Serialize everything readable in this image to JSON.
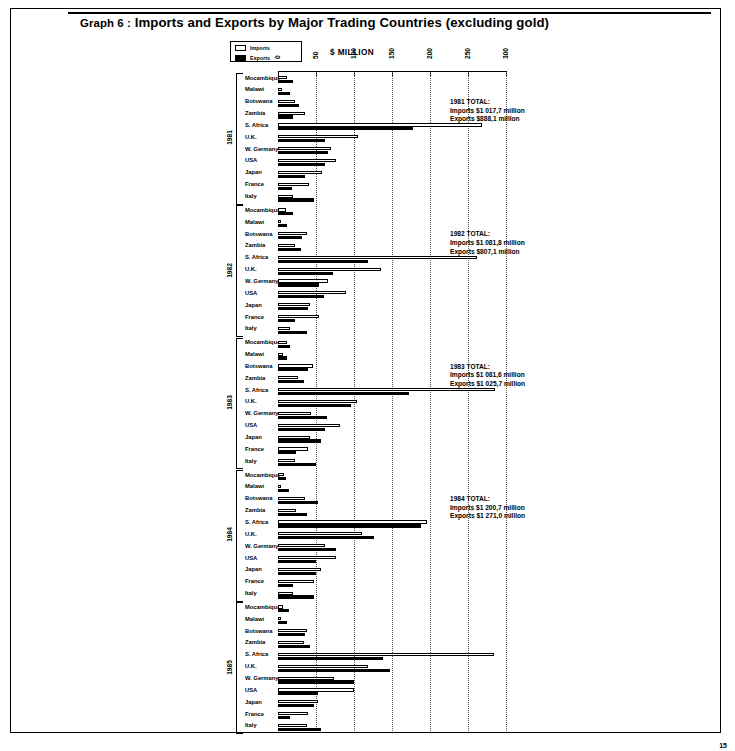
{
  "page": {
    "number": "15"
  },
  "header": {
    "graph_label": "Graph 6 :",
    "title": "Imports and Exports by Major Trading Countries (excluding gold)"
  },
  "legend": {
    "items": [
      {
        "key": "imports",
        "label": "Imports",
        "swatch": "open"
      },
      {
        "key": "exports",
        "label": "Exports",
        "swatch": "filled"
      }
    ]
  },
  "axis": {
    "title": "$ MILLION",
    "ticks": [
      "0",
      "50",
      "100",
      "150",
      "200",
      "250",
      "300"
    ],
    "min": 0,
    "max": 300
  },
  "countries": [
    "Mocambique",
    "Malawi",
    "Botswana",
    "Zambia",
    "S. Africa",
    "U.K.",
    "W. Germany",
    "USA",
    "Japan",
    "France",
    "Italy"
  ],
  "notes": [
    {
      "year": "1981",
      "line1": "1981 TOTAL:",
      "line2": "Imports $1 017,7 million",
      "line3": "Exports $888,1 million"
    },
    {
      "year": "1982",
      "line1": "1982 TOTAL:",
      "line2": "Imports $1 081,8 million",
      "line3": "Exports $807,1 million"
    },
    {
      "year": "1983",
      "line1": "1983 TOTAL:",
      "line2": "Imports $1 081,6 million",
      "line3": "Exports $1 025,7 million"
    },
    {
      "year": "1984",
      "line1": "1984 TOTAL:",
      "line2": "Imports $1 200,7 million",
      "line3": "Exports $1 271,0 million"
    }
  ],
  "years": [
    "1981",
    "1982",
    "1983",
    "1984",
    "1985"
  ],
  "chart_data": {
    "type": "bar",
    "orientation": "horizontal",
    "title": "Graph 6 : Imports and Exports by Major Trading Countries (excluding gold)",
    "xlabel": "$ MILLION",
    "ylabel": "",
    "xlim": [
      0,
      300
    ],
    "grid": true,
    "legend_position": "top-left",
    "categories": [
      "Mocambique",
      "Malawi",
      "Botswana",
      "Zambia",
      "S. Africa",
      "U.K.",
      "W. Germany",
      "USA",
      "Japan",
      "France",
      "Italy"
    ],
    "groups": [
      {
        "year": "1981",
        "series": [
          {
            "name": "Imports",
            "values": [
              12,
              5,
              22,
              36,
              268,
              105,
              70,
              76,
              58,
              41,
              20
            ]
          },
          {
            "name": "Exports",
            "values": [
              20,
              16,
              28,
              20,
              178,
              62,
              66,
              62,
              36,
              18,
              48
            ]
          }
        ]
      },
      {
        "year": "1982",
        "series": [
          {
            "name": "Imports",
            "values": [
              10,
              4,
              38,
              22,
              262,
              136,
              66,
              90,
              42,
              54,
              16
            ]
          },
          {
            "name": "Exports",
            "values": [
              20,
              12,
              32,
              30,
              118,
              72,
              54,
              60,
              40,
              22,
              38
            ]
          }
        ]
      },
      {
        "year": "1983",
        "series": [
          {
            "name": "Imports",
            "values": [
              12,
              6,
              46,
              26,
              286,
              104,
              44,
              82,
              42,
              40,
              22
            ]
          },
          {
            "name": "Exports",
            "values": [
              16,
              12,
              40,
              34,
              172,
              96,
              64,
              62,
              56,
              24,
              50
            ]
          }
        ]
      },
      {
        "year": "1984",
        "series": [
          {
            "name": "Imports",
            "values": [
              8,
              4,
              36,
              24,
              196,
              110,
              62,
              76,
              56,
              48,
              20
            ]
          },
          {
            "name": "Exports",
            "values": [
              10,
              14,
              52,
              38,
              188,
              126,
              76,
              50,
              50,
              20,
              48
            ]
          }
        ]
      },
      {
        "year": "1985",
        "series": [
          {
            "name": "Imports",
            "values": [
              6,
              4,
              38,
              34,
              284,
              118,
              74,
              100,
              52,
              40,
              38
            ]
          },
          {
            "name": "Exports",
            "values": [
              14,
              12,
              36,
              42,
              138,
              148,
              100,
              52,
              48,
              16,
              56
            ]
          }
        ]
      }
    ]
  }
}
